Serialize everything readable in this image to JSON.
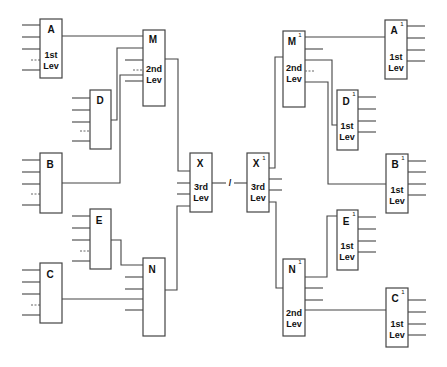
{
  "diagram": {
    "title": "",
    "left_tree": {
      "level1": [
        {
          "id": "A",
          "label": "A",
          "level_line1": "1st",
          "level_line2": "Lev"
        },
        {
          "id": "D",
          "label": "D"
        },
        {
          "id": "B",
          "label": "B"
        },
        {
          "id": "E",
          "label": "E"
        },
        {
          "id": "C",
          "label": "C"
        }
      ],
      "level2": [
        {
          "id": "M",
          "label": "M",
          "level_line1": "2nd",
          "level_line2": "Lev"
        },
        {
          "id": "N",
          "label": "N"
        }
      ],
      "level3": {
        "id": "X",
        "label": "X",
        "level_line1": "3rd",
        "level_line2": "Lev"
      }
    },
    "separator": "/",
    "right_tree": {
      "level3": {
        "id": "X1",
        "label": "X",
        "sup": "1",
        "level_line1": "3rd",
        "level_line2": "Lev"
      },
      "level2": [
        {
          "id": "M1",
          "label": "M",
          "sup": "1",
          "level_line1": "2nd",
          "level_line2": "Lev"
        },
        {
          "id": "N1",
          "label": "N",
          "sup": "1",
          "level_line1": "2nd",
          "level_line2": "Lev"
        }
      ],
      "level1": [
        {
          "id": "A1",
          "label": "A",
          "sup": "1",
          "level_line1": "1st",
          "level_line2": "Lev"
        },
        {
          "id": "D1",
          "label": "D",
          "sup": "1",
          "level_line1": "1st",
          "level_line2": "Lev"
        },
        {
          "id": "B1",
          "label": "B",
          "sup": "1",
          "level_line1": "1st",
          "level_line2": "Lev"
        },
        {
          "id": "E1",
          "label": "E",
          "sup": "1",
          "level_line1": "1st",
          "level_line2": "Lev"
        },
        {
          "id": "C1",
          "label": "C",
          "sup": "1",
          "level_line1": "1st",
          "level_line2": "Lev"
        }
      ]
    }
  }
}
